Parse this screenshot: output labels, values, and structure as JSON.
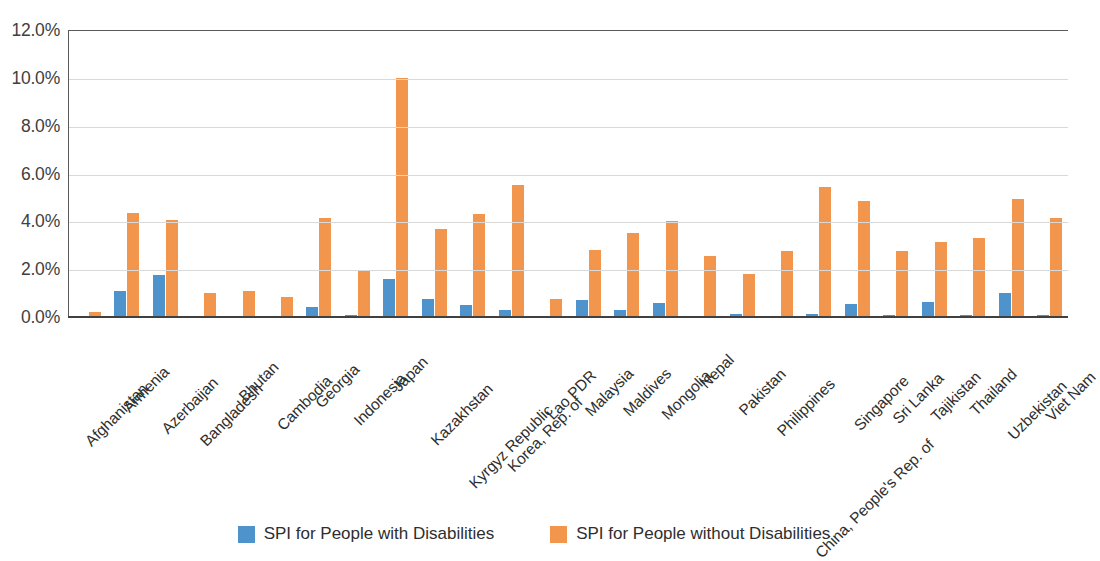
{
  "chart_data": {
    "type": "bar",
    "title": "",
    "subtitle": "",
    "xlabel": "",
    "ylabel": "",
    "ylim": [
      0,
      12
    ],
    "ytick_labels": [
      "0.0%",
      "2.0%",
      "4.0%",
      "6.0%",
      "8.0%",
      "10.0%",
      "12.0%"
    ],
    "ytick_values": [
      0,
      2,
      4,
      6,
      8,
      10,
      12
    ],
    "grid": true,
    "legend_position": "bottom",
    "value_unit": "%",
    "categories": [
      "Afghanistan",
      "Armenia",
      "Azerbaijan",
      "Bangladesh",
      "Bhutan",
      "Cambodia",
      "Georgia",
      "Indonesia",
      "Japan",
      "Kazakhstan",
      "Kyrgyz Republic",
      "Korea, Rep. of",
      "Lao PDR",
      "Malaysia",
      "Maldives",
      "Mongolia",
      "Nepal",
      "Pakistan",
      "Philippines",
      "China, People's Rep. of",
      "Singapore",
      "Sri Lanka",
      "Tajikistan",
      "Thailand",
      "Uzbekistan",
      "Viet Nam"
    ],
    "series": [
      {
        "name": "SPI for People with Disabilities",
        "color": "#4E93CB",
        "values": [
          0.05,
          1.1,
          1.75,
          0.05,
          0.0,
          0.05,
          0.4,
          0.07,
          1.6,
          0.75,
          0.5,
          0.3,
          0.05,
          0.7,
          0.3,
          0.6,
          0.0,
          0.13,
          0.05,
          0.12,
          0.55,
          0.1,
          0.62,
          0.07,
          1.0,
          0.08
        ]
      },
      {
        "name": "SPI for People without Disabilities",
        "color": "#F3964D",
        "values": [
          0.2,
          4.35,
          4.05,
          1.0,
          1.1,
          0.85,
          4.15,
          1.95,
          10.0,
          3.7,
          4.3,
          5.5,
          0.75,
          2.8,
          3.5,
          4.0,
          2.55,
          1.8,
          2.75,
          5.45,
          4.85,
          2.75,
          3.15,
          3.3,
          4.95,
          4.15
        ]
      }
    ]
  },
  "legend": {
    "items": [
      {
        "label": "SPI for People with Disabilities",
        "color": "#4E93CB"
      },
      {
        "label": "SPI for People without Disabilities",
        "color": "#F3964D"
      }
    ]
  }
}
